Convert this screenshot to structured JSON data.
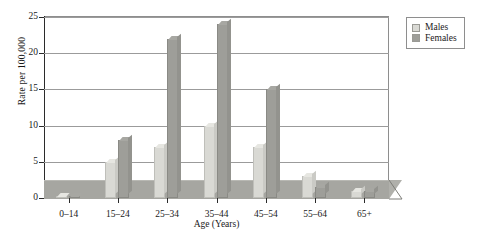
{
  "chart_data": {
    "type": "bar",
    "title": "",
    "xlabel": "Age (Years)",
    "ylabel": "Rate per 100,000",
    "categories": [
      "0–14",
      "15–24",
      "25–34",
      "35–44",
      "45–54",
      "55–64",
      "65+"
    ],
    "series": [
      {
        "name": "Males",
        "color": "#d9d9d4",
        "values": [
          0.2,
          5,
          7,
          10,
          7,
          3,
          1
        ]
      },
      {
        "name": "Females",
        "color": "#9e9e99",
        "values": [
          0.2,
          8,
          22,
          24,
          15,
          1.5,
          1
        ]
      }
    ],
    "ylim": [
      0,
      25
    ],
    "yticks": [
      0,
      5,
      10,
      15,
      20,
      25
    ],
    "ytick_labels": [
      "0",
      "5",
      "10",
      "15",
      "20",
      "25"
    ],
    "grid": true,
    "legend_position": "top-right",
    "style": "3d-column"
  },
  "legend": {
    "items": [
      {
        "label": "Males"
      },
      {
        "label": "Females"
      }
    ]
  }
}
